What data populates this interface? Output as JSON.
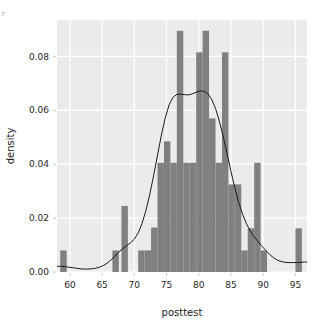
{
  "chart_data": {
    "type": "bar",
    "title": "",
    "subtitle": "",
    "xlabel": "posttest",
    "ylabel": "density",
    "xlim": [
      58.0,
      96.8
    ],
    "ylim": [
      0.0,
      0.0935
    ],
    "grid": true,
    "legend": "none",
    "xticks": [
      60,
      65,
      70,
      75,
      80,
      85,
      90,
      95
    ],
    "xtick_labels": [
      "60",
      "65",
      "70",
      "75",
      "80",
      "85",
      "90",
      "95"
    ],
    "yticks": [
      0.0,
      0.02,
      0.04,
      0.06,
      0.08
    ],
    "ytick_labels": [
      "0.00",
      "0.02",
      "0.04",
      "0.06",
      "0.08"
    ],
    "bin_width": 1.0,
    "bars": [
      {
        "x0": 58.5,
        "x1": 59.5,
        "value": 0.008
      },
      {
        "x0": 66.6,
        "x1": 67.6,
        "value": 0.008
      },
      {
        "x0": 68.0,
        "x1": 69.0,
        "value": 0.0245
      },
      {
        "x0": 70.6,
        "x1": 71.6,
        "value": 0.008
      },
      {
        "x0": 71.6,
        "x1": 72.6,
        "value": 0.008
      },
      {
        "x0": 72.6,
        "x1": 73.6,
        "value": 0.0165
      },
      {
        "x0": 73.6,
        "x1": 74.6,
        "value": 0.0405
      },
      {
        "x0": 74.6,
        "x1": 75.6,
        "value": 0.0485
      },
      {
        "x0": 75.6,
        "x1": 76.6,
        "value": 0.0405
      },
      {
        "x0": 76.6,
        "x1": 77.6,
        "value": 0.0895
      },
      {
        "x0": 77.6,
        "x1": 78.6,
        "value": 0.0405
      },
      {
        "x0": 78.6,
        "x1": 79.6,
        "value": 0.0405
      },
      {
        "x0": 79.6,
        "x1": 80.6,
        "value": 0.0815
      },
      {
        "x0": 80.6,
        "x1": 81.6,
        "value": 0.0895
      },
      {
        "x0": 81.6,
        "x1": 82.6,
        "value": 0.057
      },
      {
        "x0": 82.6,
        "x1": 83.6,
        "value": 0.0405
      },
      {
        "x0": 83.6,
        "x1": 84.6,
        "value": 0.0815
      },
      {
        "x0": 84.6,
        "x1": 85.6,
        "value": 0.0325
      },
      {
        "x0": 85.6,
        "x1": 86.6,
        "value": 0.0325
      },
      {
        "x0": 86.6,
        "x1": 87.6,
        "value": 0.008
      },
      {
        "x0": 87.6,
        "x1": 88.6,
        "value": 0.0162
      },
      {
        "x0": 88.6,
        "x1": 89.6,
        "value": 0.0405
      },
      {
        "x0": 89.6,
        "x1": 90.6,
        "value": 0.008
      },
      {
        "x0": 95.0,
        "x1": 96.0,
        "value": 0.0162
      }
    ],
    "density_curve": {
      "name": "kde",
      "x": [
        58.0,
        58.6,
        59.2,
        59.8,
        60.4,
        61.0,
        61.6,
        62.2,
        62.8,
        63.4,
        64.0,
        64.6,
        65.2,
        65.8,
        66.4,
        67.0,
        67.6,
        68.2,
        68.8,
        69.4,
        70.0,
        70.6,
        71.2,
        71.8,
        72.4,
        73.0,
        73.6,
        74.2,
        74.8,
        75.4,
        76.0,
        76.6,
        77.2,
        77.8,
        78.4,
        79.0,
        79.6,
        80.2,
        80.8,
        81.4,
        82.0,
        82.6,
        83.2,
        83.8,
        84.4,
        85.0,
        85.6,
        86.2,
        86.8,
        87.4,
        88.0,
        88.6,
        89.2,
        89.8,
        90.4,
        91.0,
        91.6,
        92.2,
        92.8,
        93.4,
        94.0,
        94.6,
        95.2,
        95.8,
        96.4,
        96.8
      ],
      "y": [
        0.0021,
        0.0021,
        0.002,
        0.0018,
        0.0016,
        0.0014,
        0.0012,
        0.0011,
        0.0011,
        0.0012,
        0.0014,
        0.0018,
        0.0024,
        0.0033,
        0.0045,
        0.0059,
        0.0074,
        0.0087,
        0.0098,
        0.0108,
        0.0122,
        0.0145,
        0.018,
        0.0228,
        0.0288,
        0.0358,
        0.0434,
        0.0508,
        0.0572,
        0.062,
        0.0648,
        0.0659,
        0.066,
        0.0658,
        0.0657,
        0.0661,
        0.0667,
        0.0672,
        0.0671,
        0.0662,
        0.0641,
        0.0607,
        0.056,
        0.0502,
        0.0438,
        0.0373,
        0.0312,
        0.0258,
        0.0214,
        0.0179,
        0.0152,
        0.0131,
        0.0113,
        0.0096,
        0.008,
        0.0065,
        0.0053,
        0.0044,
        0.0039,
        0.0036,
        0.0035,
        0.0035,
        0.0035,
        0.0036,
        0.0037,
        0.0037
      ]
    },
    "colors": {
      "bar_fill": "#808080",
      "curve_line": "#1a1a1a",
      "plot_background": "#ebebeb",
      "gridline": "#ffffff",
      "page_background": "#ffffff",
      "tick_text": "#262626"
    }
  },
  "corner_mark": "r"
}
